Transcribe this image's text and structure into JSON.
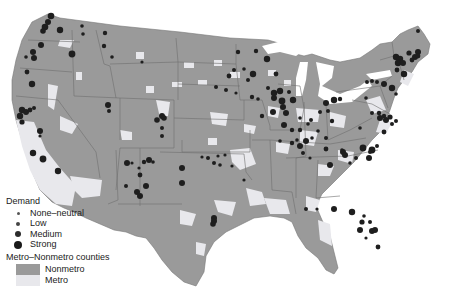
{
  "map": {
    "colors": {
      "nonmetro": "#9a9a9a",
      "metro": "#e8e8ec",
      "state_border": "#6e6e6e",
      "dot": "#1e1e1e",
      "dot_low": "#4a4a4a",
      "background": "#ffffff"
    }
  },
  "legend": {
    "demand_title": "Demand",
    "demand_items": [
      {
        "label": "None–neutral",
        "size": 3
      },
      {
        "label": "Low",
        "size": 4.5
      },
      {
        "label": "Medium",
        "size": 6
      },
      {
        "label": "Strong",
        "size": 8
      }
    ],
    "county_title": "Metro–Nonmetro counties",
    "county_items": [
      {
        "label": "Nonmetro",
        "color": "#9a9a9a"
      },
      {
        "label": "Metro",
        "color": "#e8e8ec"
      }
    ]
  }
}
